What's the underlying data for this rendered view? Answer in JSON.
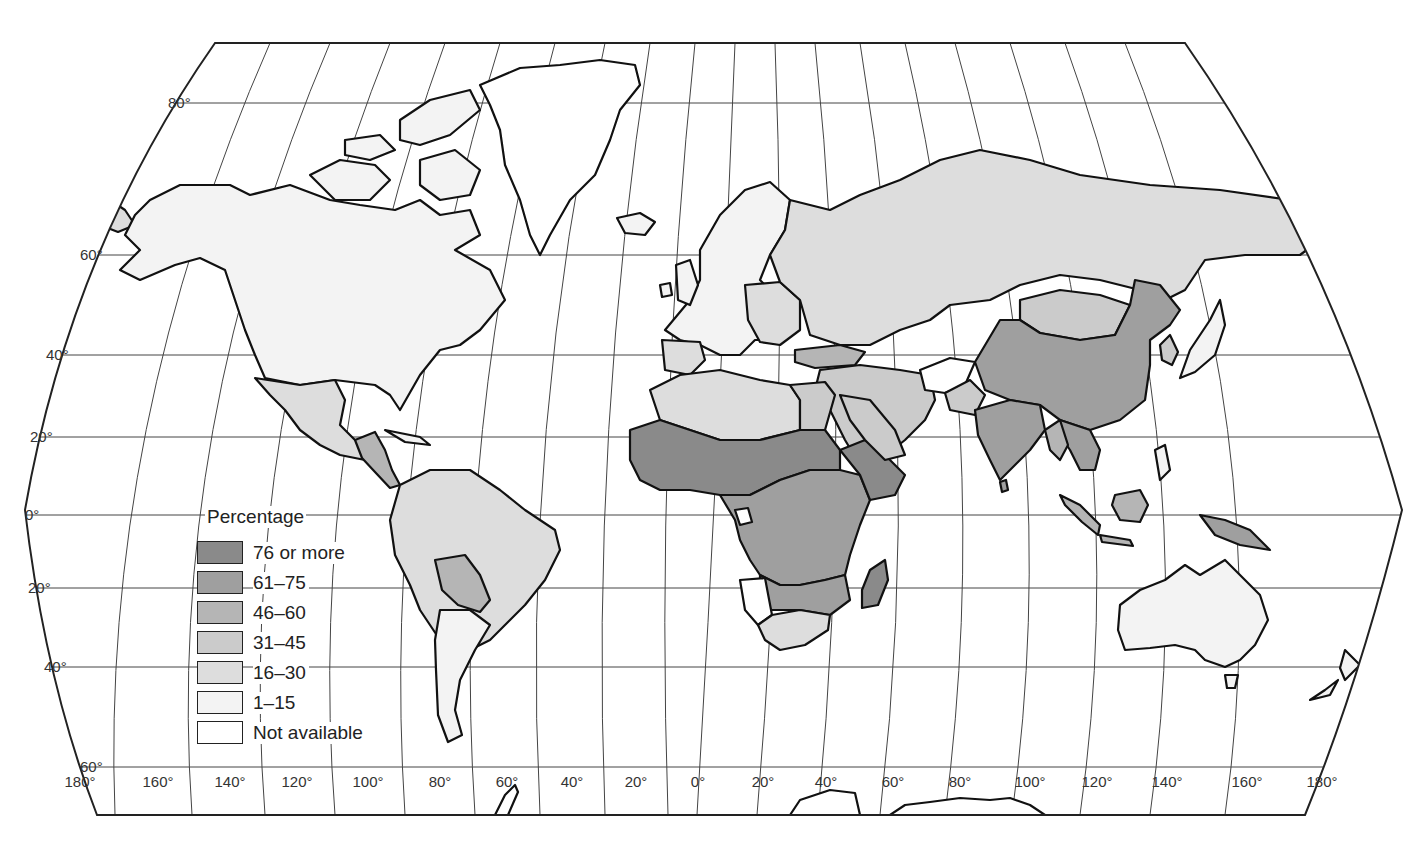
{
  "map": {
    "type": "choropleth world map",
    "projection": "pseudo-cylindrical (curved sides)",
    "frame": {
      "top_edge": {
        "y": 43,
        "x_start": 215,
        "x_end": 1185
      },
      "bottom_edge": {
        "y": 815,
        "x_start": 97,
        "x_end": 1305
      }
    },
    "latitude_labels": [
      {
        "text": "80°",
        "x": 168,
        "y": 103
      },
      {
        "text": "60°",
        "x": 80,
        "y": 255
      },
      {
        "text": "40°",
        "x": 46,
        "y": 355
      },
      {
        "text": "20°",
        "x": 30,
        "y": 437
      },
      {
        "text": "0°",
        "x": 25,
        "y": 515
      },
      {
        "text": "20°",
        "x": 28,
        "y": 588
      },
      {
        "text": "40°",
        "x": 44,
        "y": 667
      },
      {
        "text": "60°",
        "x": 80,
        "y": 767
      }
    ],
    "longitude_labels": [
      {
        "text": "180°",
        "x": 80
      },
      {
        "text": "160°",
        "x": 158
      },
      {
        "text": "140°",
        "x": 230
      },
      {
        "text": "120°",
        "x": 297
      },
      {
        "text": "100°",
        "x": 368
      },
      {
        "text": "80°",
        "x": 440
      },
      {
        "text": "60°",
        "x": 507
      },
      {
        "text": "40°",
        "x": 572
      },
      {
        "text": "20°",
        "x": 636
      },
      {
        "text": "0°",
        "x": 698
      },
      {
        "text": "20°",
        "x": 763
      },
      {
        "text": "40°",
        "x": 826
      },
      {
        "text": "60°",
        "x": 893
      },
      {
        "text": "80°",
        "x": 960
      },
      {
        "text": "100°",
        "x": 1030
      },
      {
        "text": "120°",
        "x": 1097
      },
      {
        "text": "140°",
        "x": 1167
      },
      {
        "text": "160°",
        "x": 1247
      },
      {
        "text": "180°",
        "x": 1322
      }
    ]
  },
  "legend": {
    "title": "Percentage",
    "items": [
      {
        "label": "76 or more",
        "color": "#8a8a8a"
      },
      {
        "label": "61–75",
        "color": "#9f9f9f"
      },
      {
        "label": "46–60",
        "color": "#b5b5b5"
      },
      {
        "label": "31–45",
        "color": "#cbcbcb"
      },
      {
        "label": "16–30",
        "color": "#dddddd"
      },
      {
        "label": "1–15",
        "color": "#f3f3f3"
      },
      {
        "label": "Not available",
        "color": "#ffffff"
      }
    ]
  },
  "regions": [
    {
      "name": "North America (USA/Canada)",
      "category": "1–15"
    },
    {
      "name": "Greenland",
      "category": "Not available"
    },
    {
      "name": "Mexico",
      "category": "16–30"
    },
    {
      "name": "Central America",
      "category": "31–45 / 46–60"
    },
    {
      "name": "South America (most)",
      "category": "16–30"
    },
    {
      "name": "Bolivia",
      "category": "31–45"
    },
    {
      "name": "Paraguay",
      "category": "31–45"
    },
    {
      "name": "Argentina",
      "category": "1–15"
    },
    {
      "name": "Chile",
      "category": "16–30"
    },
    {
      "name": "Europe (west/north)",
      "category": "1–15"
    },
    {
      "name": "Eastern Europe",
      "category": "16–30"
    },
    {
      "name": "Soviet Union",
      "category": "16–30"
    },
    {
      "name": "Turkey",
      "category": "46–60"
    },
    {
      "name": "North Africa (Libya/Algeria)",
      "category": "16–30"
    },
    {
      "name": "West/Central/East Africa",
      "category": "61–75 / 76 or more"
    },
    {
      "name": "Namibia",
      "category": "Not available"
    },
    {
      "name": "South Africa",
      "category": "16–30"
    },
    {
      "name": "Madagascar",
      "category": "76 or more"
    },
    {
      "name": "Middle East",
      "category": "31–45"
    },
    {
      "name": "Afghanistan",
      "category": "Not available"
    },
    {
      "name": "China",
      "category": "61–75"
    },
    {
      "name": "India",
      "category": "61–75"
    },
    {
      "name": "Mongolia",
      "category": "31–45"
    },
    {
      "name": "Southeast Asia",
      "category": "46–60 / 61–75"
    },
    {
      "name": "Indonesia",
      "category": "46–60"
    },
    {
      "name": "Japan",
      "category": "1–15"
    },
    {
      "name": "Australia",
      "category": "1–15"
    },
    {
      "name": "New Zealand",
      "category": "1–15"
    },
    {
      "name": "Papua New Guinea",
      "category": "61–75"
    }
  ]
}
